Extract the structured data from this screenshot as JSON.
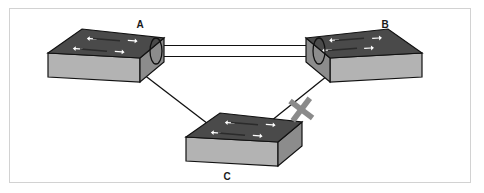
{
  "diagram": {
    "type": "network-topology",
    "frame": {
      "border_color": "#d2d2d2",
      "background_color": "#ffffff"
    },
    "colors": {
      "switch_top_face": "#4a4a4a",
      "switch_front_face": "#b3b3b3",
      "switch_side_face": "#8c8c8c",
      "switch_outline": "#111111",
      "arrow_fill": "#ffffff",
      "link_line": "#111111",
      "blocked_mark": "#8a8a8a",
      "label_text": "#1a1a1a"
    },
    "nodes": [
      {
        "id": "A",
        "label": "A",
        "name": "switch-a",
        "device_type": "switch",
        "position": {
          "x": 83,
          "y": 24
        },
        "label_position": {
          "x": 120,
          "y": 11
        }
      },
      {
        "id": "B",
        "label": "B",
        "name": "switch-b",
        "device_type": "switch",
        "position": {
          "x": 325,
          "y": 24
        },
        "label_position": {
          "x": 365,
          "y": 11
        }
      },
      {
        "id": "C",
        "label": "C",
        "name": "switch-c",
        "device_type": "switch",
        "position": {
          "x": 183,
          "y": 118
        },
        "label_position": {
          "x": 207,
          "y": 163
        }
      }
    ],
    "links": [
      {
        "id": "link-a-b",
        "from": "A",
        "to": "B",
        "style": "parallel-pair",
        "line_count": 2,
        "status": "active",
        "markers": [
          "cable-bundle-oval",
          "cable-bundle-oval"
        ]
      },
      {
        "id": "link-a-c",
        "from": "A",
        "to": "C",
        "style": "single",
        "line_count": 1,
        "status": "active",
        "markers": []
      },
      {
        "id": "link-c-b",
        "from": "C",
        "to": "B",
        "style": "single",
        "line_count": 1,
        "status": "blocked",
        "markers": [
          "blocked-x"
        ]
      }
    ],
    "annotations": [
      {
        "id": "blocked-x",
        "name": "blocked-link-x-marker",
        "symbol": "X",
        "meaning": "link blocked",
        "position": {
          "x": 289,
          "y": 100
        },
        "color": "#8a8a8a"
      }
    ]
  }
}
